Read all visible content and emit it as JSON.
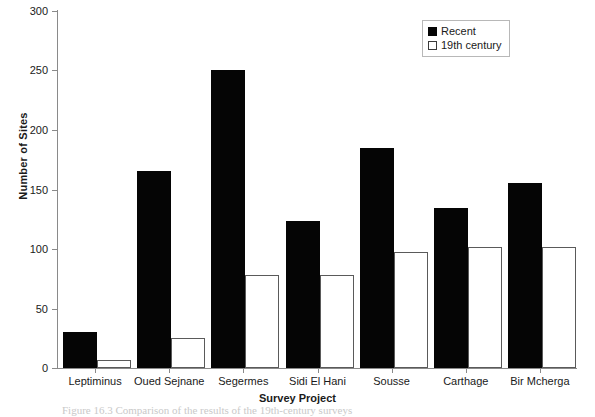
{
  "chart_data": {
    "type": "bar",
    "title": "",
    "xlabel": "Survey Project",
    "ylabel": "Number of Sites",
    "ylim": [
      0,
      300
    ],
    "yticks": [
      0,
      50,
      100,
      150,
      200,
      250,
      300
    ],
    "grid": false,
    "legend_position": "top-right",
    "categories": [
      "Leptiminus",
      "Oued Sejnane",
      "Segermes",
      "Sidi El Hani",
      "Sousse",
      "Carthage",
      "Bir Mcherga"
    ],
    "series": [
      {
        "name": "Recent",
        "color": "#050505",
        "values": [
          30,
          165,
          250,
          123,
          184,
          134,
          155
        ]
      },
      {
        "name": "19th century",
        "color": "#ffffff",
        "values": [
          7,
          25,
          78,
          78,
          97,
          101,
          101
        ]
      }
    ]
  },
  "figure": {
    "caption": "Figure 16.3  Comparison of the results of the 19th-century surveys"
  }
}
